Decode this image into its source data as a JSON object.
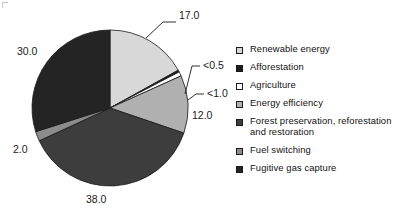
{
  "chart_data": {
    "type": "pie",
    "title": "",
    "categories": [
      "Renewable energy",
      "Afforestation",
      "Agriculture",
      "Energy efficiency",
      "Forest preservation, reforestation and restoration",
      "Fuel switching",
      "Fugitive gas capture"
    ],
    "values": [
      17.0,
      0.4,
      0.9,
      12.0,
      38.0,
      2.0,
      30.0
    ],
    "value_labels": [
      "17.0",
      "<0.5",
      "<1.0",
      "12.0",
      "38.0",
      "2.0",
      "30.0"
    ],
    "colors": [
      "#d8d8d8",
      "#1d1d1d",
      "#ffffff",
      "#b0b0b0",
      "#3d3d3d",
      "#8c8c8c",
      "#242424"
    ],
    "legend_position": "right",
    "grid": false,
    "start_angle_deg": 0,
    "direction": "clockwise"
  },
  "labels": {
    "renewable": "17.0",
    "afforestation": "<0.5",
    "agriculture": "<1.0",
    "energy_efficiency": "12.0",
    "forest_preservation": "38.0",
    "fuel_switching": "2.0",
    "fugitive_gas": "30.0"
  },
  "legend": {
    "items": [
      {
        "label": "Renewable energy",
        "color": "#d8d8d8"
      },
      {
        "label": "Afforestation",
        "color": "#1d1d1d"
      },
      {
        "label": "Agriculture",
        "color": "#ffffff"
      },
      {
        "label": "Energy efficiency",
        "color": "#b0b0b0"
      },
      {
        "label": "Forest preservation, reforestation and restoration",
        "color": "#3d3d3d"
      },
      {
        "label": "Fuel switching",
        "color": "#8c8c8c"
      },
      {
        "label": "Fugitive gas capture",
        "color": "#242424"
      }
    ]
  }
}
